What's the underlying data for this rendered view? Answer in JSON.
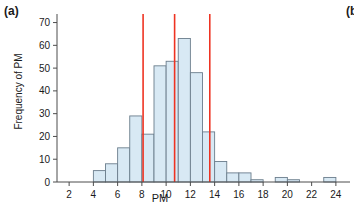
{
  "figure": {
    "panel_label": "(a)",
    "adjacent_panel_label": "(b",
    "width": 355,
    "height": 209
  },
  "colors": {
    "bar_fill": "#d8e9f4",
    "bar_stroke": "#6b7d8c",
    "axis": "#4d4d4d",
    "marker_line": "#ee3322",
    "text": "#1a1a1a",
    "background": "#ffffff"
  },
  "chart_data": {
    "type": "bar",
    "subtype": "histogram",
    "title": "",
    "xlabel": "PM",
    "ylabel": "Frequency of PM",
    "xlim": [
      1,
      25
    ],
    "ylim": [
      0,
      72
    ],
    "grid": false,
    "legend": null,
    "xticks": [
      2,
      4,
      6,
      8,
      10,
      12,
      14,
      16,
      18,
      20,
      22,
      24
    ],
    "yticks": [
      0,
      10,
      20,
      30,
      40,
      50,
      60,
      70
    ],
    "xtick_labels": [
      "2",
      "4",
      "6",
      "8",
      "10",
      "12",
      "14",
      "16",
      "18",
      "20",
      "22",
      "24"
    ],
    "ytick_labels": [
      "0",
      "10",
      "20",
      "30",
      "40",
      "50",
      "60",
      "70"
    ],
    "bin_width": 1,
    "bins": [
      {
        "x0": 4,
        "x1": 5,
        "value": 5
      },
      {
        "x0": 5,
        "x1": 6,
        "value": 8
      },
      {
        "x0": 6,
        "x1": 7,
        "value": 15
      },
      {
        "x0": 7,
        "x1": 8,
        "value": 29
      },
      {
        "x0": 8,
        "x1": 9,
        "value": 21
      },
      {
        "x0": 9,
        "x1": 10,
        "value": 51
      },
      {
        "x0": 10,
        "x1": 11,
        "value": 53
      },
      {
        "x0": 11,
        "x1": 12,
        "value": 63
      },
      {
        "x0": 12,
        "x1": 13,
        "value": 48
      },
      {
        "x0": 13,
        "x1": 14,
        "value": 22
      },
      {
        "x0": 14,
        "x1": 15,
        "value": 9
      },
      {
        "x0": 15,
        "x1": 16,
        "value": 4
      },
      {
        "x0": 16,
        "x1": 17,
        "value": 4
      },
      {
        "x0": 17,
        "x1": 18,
        "value": 1
      },
      {
        "x0": 19,
        "x1": 20,
        "value": 2
      },
      {
        "x0": 20,
        "x1": 21,
        "value": 1
      },
      {
        "x0": 23,
        "x1": 24,
        "value": 2
      }
    ],
    "categories": [
      "4",
      "5",
      "6",
      "7",
      "8",
      "9",
      "10",
      "11",
      "12",
      "13",
      "14",
      "15",
      "16",
      "17",
      "19",
      "20",
      "23"
    ],
    "values": [
      5,
      8,
      15,
      29,
      21,
      51,
      53,
      63,
      48,
      22,
      9,
      4,
      4,
      1,
      2,
      1,
      2
    ],
    "annotations": [
      {
        "type": "vline",
        "x": 8.1,
        "label": "marker-line-1"
      },
      {
        "type": "vline",
        "x": 10.7,
        "label": "marker-line-2"
      },
      {
        "type": "vline",
        "x": 13.6,
        "label": "marker-line-3"
      }
    ]
  }
}
